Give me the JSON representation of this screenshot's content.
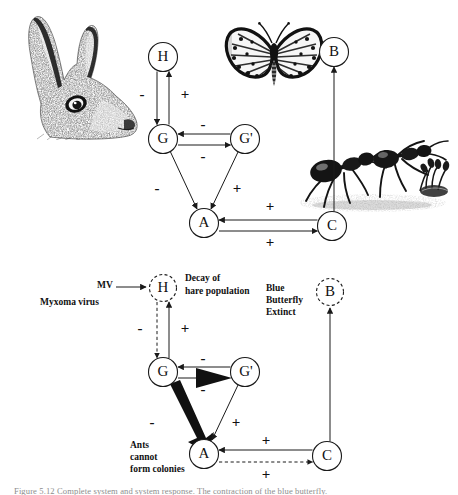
{
  "figure": {
    "caption": "Figure 5.12   Complete system and system response. The contraction of the blue butterfly."
  },
  "panels": [
    {
      "id": "top",
      "name": "undisturbed-system",
      "nodes": [
        {
          "id": "H",
          "label": "H",
          "x": 163,
          "y": 57,
          "r": 14.5,
          "style": "solid"
        },
        {
          "id": "G",
          "label": "G",
          "x": 163,
          "y": 139,
          "r": 14.5,
          "style": "solid"
        },
        {
          "id": "Gp",
          "label": "G'",
          "x": 245,
          "y": 139,
          "r": 14.5,
          "style": "solid"
        },
        {
          "id": "A",
          "label": "A",
          "x": 204,
          "y": 223,
          "r": 14.5,
          "style": "solid"
        },
        {
          "id": "C",
          "label": "C",
          "x": 332,
          "y": 226,
          "r": 14.5,
          "style": "solid"
        },
        {
          "id": "B",
          "label": "B",
          "x": 334,
          "y": 52,
          "r": 14.5,
          "style": "solid"
        }
      ],
      "edges": [
        {
          "from": "H",
          "to": "G",
          "sign": "-",
          "style": "solid",
          "weight": "thin"
        },
        {
          "from": "G",
          "to": "H",
          "sign": "+",
          "style": "solid",
          "weight": "thin"
        },
        {
          "from": "Gp",
          "to": "G",
          "sign": "-",
          "style": "solid",
          "weight": "thin"
        },
        {
          "from": "G",
          "to": "Gp",
          "sign": "-",
          "style": "solid",
          "weight": "thin"
        },
        {
          "from": "G",
          "to": "A",
          "sign": "-",
          "style": "solid",
          "weight": "thin"
        },
        {
          "from": "Gp",
          "to": "A",
          "sign": "+",
          "style": "solid",
          "weight": "thin"
        },
        {
          "from": "C",
          "to": "A",
          "sign": "+",
          "style": "solid",
          "weight": "thin"
        },
        {
          "from": "A",
          "to": "C",
          "sign": "+",
          "style": "solid",
          "weight": "thin"
        },
        {
          "from": "C",
          "to": "B",
          "sign": "",
          "style": "solid",
          "weight": "thin"
        }
      ],
      "signs": [
        {
          "text": "-",
          "x": 142,
          "y": 96
        },
        {
          "text": "+",
          "x": 185,
          "y": 96
        },
        {
          "text": "-",
          "x": 203,
          "y": 126
        },
        {
          "text": "-",
          "x": 203,
          "y": 158
        },
        {
          "text": "-",
          "x": 157,
          "y": 190
        },
        {
          "text": "+",
          "x": 237,
          "y": 190
        },
        {
          "text": "+",
          "x": 270,
          "y": 208
        },
        {
          "text": "+",
          "x": 270,
          "y": 244
        }
      ]
    },
    {
      "id": "bottom",
      "name": "perturbed-system",
      "nodes": [
        {
          "id": "H",
          "label": "H",
          "x": 163,
          "y": 30,
          "r": 13.5,
          "style": "dashed"
        },
        {
          "id": "G",
          "label": "G",
          "x": 163,
          "y": 114,
          "r": 14.5,
          "style": "solid"
        },
        {
          "id": "Gp",
          "label": "G'",
          "x": 245,
          "y": 114,
          "r": 14.5,
          "style": "solid"
        },
        {
          "id": "A",
          "label": "A",
          "x": 204,
          "y": 196,
          "r": 14.5,
          "style": "solid"
        },
        {
          "id": "C",
          "label": "C",
          "x": 327,
          "y": 198,
          "r": 14.5,
          "style": "solid"
        },
        {
          "id": "B",
          "label": "B",
          "x": 330,
          "y": 34,
          "r": 13.5,
          "style": "dashed"
        }
      ],
      "edges": [
        {
          "from": "MV",
          "to": "H",
          "sign": "",
          "style": "solid",
          "weight": "thin"
        },
        {
          "from": "H",
          "to": "G",
          "sign": "-",
          "style": "dashed",
          "weight": "thin"
        },
        {
          "from": "G",
          "to": "H",
          "sign": "+",
          "style": "solid",
          "weight": "thin"
        },
        {
          "from": "Gp",
          "to": "G",
          "sign": "-",
          "style": "solid",
          "weight": "thin"
        },
        {
          "from": "G",
          "to": "Gp",
          "sign": "-",
          "style": "solid",
          "weight": "bold"
        },
        {
          "from": "G",
          "to": "A",
          "sign": "-",
          "style": "solid",
          "weight": "bold"
        },
        {
          "from": "Gp",
          "to": "A",
          "sign": "+",
          "style": "solid",
          "weight": "thin"
        },
        {
          "from": "C",
          "to": "A",
          "sign": "+",
          "style": "solid",
          "weight": "thin"
        },
        {
          "from": "A",
          "to": "C",
          "sign": "+",
          "style": "dashed",
          "weight": "thin"
        },
        {
          "from": "C",
          "to": "B",
          "sign": "",
          "style": "solid",
          "weight": "thin"
        }
      ],
      "signs": [
        {
          "text": "-",
          "x": 140,
          "y": 72
        },
        {
          "text": "+",
          "x": 185,
          "y": 72
        },
        {
          "text": "-",
          "x": 203,
          "y": 102
        },
        {
          "text": "-",
          "x": 203,
          "y": 133
        },
        {
          "text": "-",
          "x": 152,
          "y": 166
        },
        {
          "text": "+",
          "x": 236,
          "y": 166
        },
        {
          "text": "+",
          "x": 266,
          "y": 184
        },
        {
          "text": "+",
          "x": 266,
          "y": 218
        }
      ],
      "annotations": [
        {
          "name": "mv-source-label",
          "lines": [
            "MV"
          ],
          "x": 105,
          "y": 28,
          "align": "center"
        },
        {
          "name": "myxoma-virus-label",
          "lines": [
            "Myxoma virus"
          ],
          "x": 96,
          "y": 45,
          "align": "start"
        },
        {
          "name": "hare-decay-label",
          "lines": [
            "Decay of",
            "hare population"
          ],
          "x": 185,
          "y": 25,
          "align": "start"
        },
        {
          "name": "butterfly-extinct-label",
          "lines": [
            "Blue",
            "Butterfly",
            "Extinct"
          ],
          "x": 266,
          "y": 36,
          "align": "start"
        },
        {
          "name": "ants-colonies-label",
          "lines": [
            "Ants",
            "cannot",
            "form colonies"
          ],
          "x": 130,
          "y": 189,
          "align": "start"
        }
      ]
    }
  ],
  "illustrations": [
    {
      "name": "hare-illustration",
      "subject": "hare head engraving"
    },
    {
      "name": "butterfly-illustration",
      "subject": "blue butterfly engraving"
    },
    {
      "name": "ants-illustration",
      "subject": "ants engraving"
    }
  ]
}
